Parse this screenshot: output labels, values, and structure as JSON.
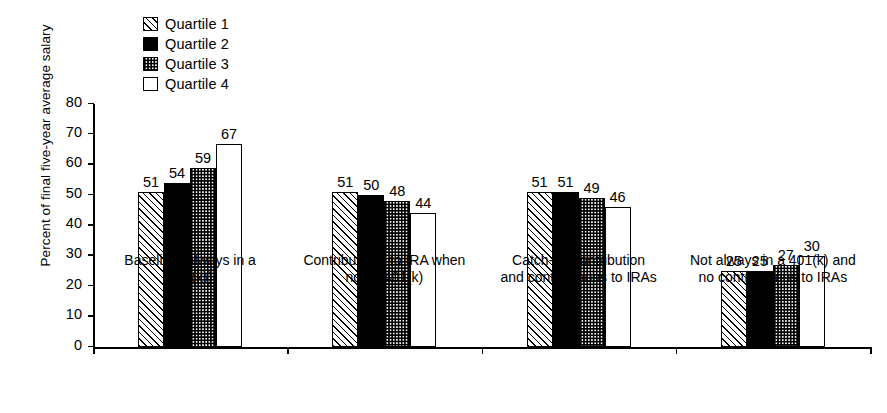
{
  "chart_data": {
    "type": "bar",
    "title": "",
    "xlabel": "",
    "ylabel": "Percent of final five-year average salary",
    "ylim": [
      0,
      80
    ],
    "yticks": [
      0,
      10,
      20,
      30,
      40,
      50,
      60,
      70,
      80
    ],
    "grid": false,
    "legend_position": "top-left",
    "categories": [
      "Baseline (always in a\n401(k))",
      "Contributions to IRA when\nnot in 401(k)",
      "Catch-up contribution\nand contributions to IRAs",
      "Not always in a 401(k) and\nno contributions to IRAs"
    ],
    "series": [
      {
        "name": "Quartile 1",
        "pattern": "diagonal-hatch",
        "values": [
          51,
          51,
          51,
          25
        ]
      },
      {
        "name": "Quartile 2",
        "pattern": "solid-black",
        "values": [
          54,
          50,
          51,
          25
        ]
      },
      {
        "name": "Quartile 3",
        "pattern": "checkerboard",
        "values": [
          59,
          48,
          49,
          27
        ]
      },
      {
        "name": "Quartile 4",
        "pattern": "empty-white",
        "values": [
          67,
          44,
          46,
          30
        ]
      }
    ]
  },
  "legend": {
    "items": [
      {
        "label": "Quartile 1",
        "swatch": "diagonal-hatch-swatch"
      },
      {
        "label": "Quartile 2",
        "swatch": "solid-black-swatch"
      },
      {
        "label": "Quartile 3",
        "swatch": "checkerboard-swatch"
      },
      {
        "label": "Quartile 4",
        "swatch": "empty-white-swatch"
      }
    ]
  },
  "colors": {
    "ink": "#000000",
    "paper": "#ffffff"
  }
}
